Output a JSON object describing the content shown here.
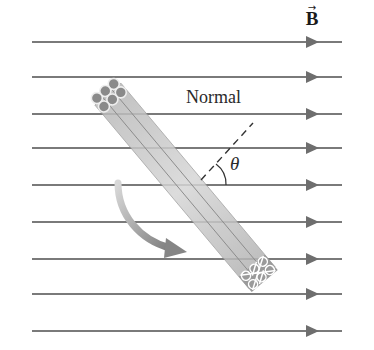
{
  "diagram": {
    "field_label": "B",
    "field_vector_arrow": "→",
    "normal_label": "Normal",
    "angle_label": "θ",
    "field_lines_y": [
      42,
      77,
      114,
      148,
      185,
      222,
      259,
      294,
      331
    ],
    "field_line_x_start": 32,
    "field_line_x_end": 342,
    "arrowhead_x": 306,
    "colors": {
      "field_line": "#7a7a7a",
      "coil_fill": "#c8c8c8",
      "coil_edge": "#8a8a8a",
      "rotation_arrow": "#8c8c8c",
      "text": "#222222"
    },
    "components": [
      "magnetic field lines",
      "coil (side view)",
      "normal (dashed)",
      "angle theta",
      "rotation arrow"
    ]
  }
}
